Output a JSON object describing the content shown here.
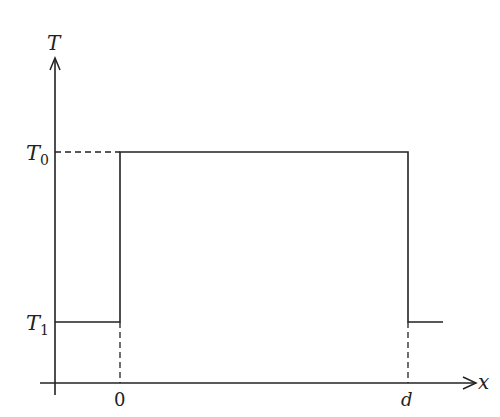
{
  "diagram": {
    "axes": {
      "y_label": "T",
      "x_label": "x"
    },
    "levels": {
      "high": {
        "label_main": "T",
        "label_sub": "0"
      },
      "low": {
        "label_main": "T",
        "label_sub": "1"
      }
    },
    "x_ticks": [
      {
        "label": "0",
        "italic": false
      },
      {
        "label": "d",
        "italic": true
      }
    ],
    "colors": {
      "line": "#222222",
      "background": "#ffffff"
    }
  }
}
